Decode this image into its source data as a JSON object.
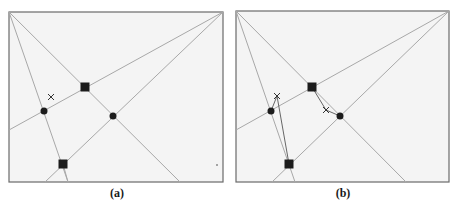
{
  "figure": {
    "panels": [
      {
        "id": "a",
        "label": "(a)"
      },
      {
        "id": "b",
        "label": "(b)"
      }
    ],
    "colors": {
      "frame": "#6a6a6a",
      "lines": "#a8a8a8",
      "markers": "#1c1c1c",
      "background": "#f4f4f4"
    },
    "legend_markers": [
      "filled-square",
      "filled-circle",
      "cross"
    ]
  }
}
